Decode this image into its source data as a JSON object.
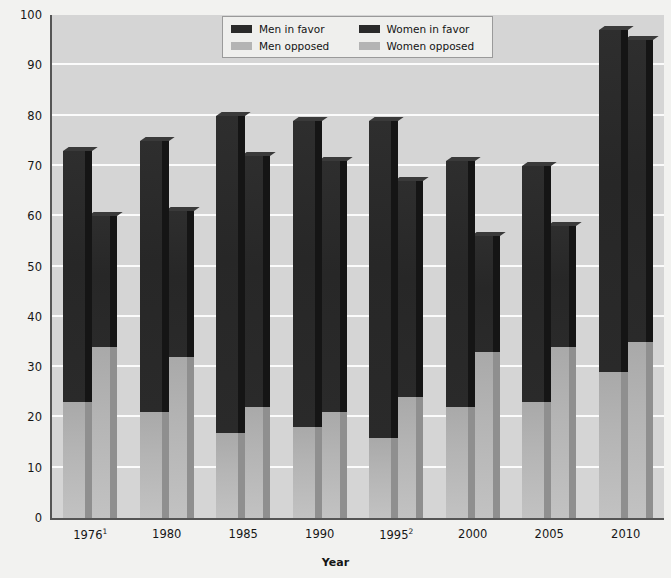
{
  "chart_data": {
    "type": "bar",
    "subtype": "grouped-stacked-3d",
    "title": "",
    "xlabel": "Year",
    "ylabel": "",
    "ylim": [
      0,
      100
    ],
    "ytick_values": [
      0,
      10,
      20,
      30,
      40,
      50,
      60,
      70,
      80,
      90,
      100
    ],
    "ytick_labels": [
      "0",
      "10",
      "20",
      "30",
      "40",
      "50",
      "60",
      "70",
      "80",
      "90",
      "100"
    ],
    "grid": "horizontal",
    "legend_position": "top-center",
    "categories": [
      "1976",
      "1980",
      "1985",
      "1990",
      "1995",
      "2000",
      "2005",
      "2010"
    ],
    "category_labels": [
      "1976¹",
      "1980",
      "1985",
      "1990",
      "1995²",
      "2000",
      "2005",
      "2010"
    ],
    "category_footnotes": [
      "1",
      "",
      "",
      "",
      "2",
      "",
      "",
      ""
    ],
    "series": [
      {
        "name": "Men in favor",
        "group": "Men",
        "stack": "top",
        "color": "#2a2a2a",
        "values": [
          73,
          75,
          80,
          79,
          79,
          71,
          70,
          97
        ]
      },
      {
        "name": "Men opposed",
        "group": "Men",
        "stack": "bottom",
        "color": "#b4b4b4",
        "values": [
          23,
          21,
          17,
          18,
          16,
          22,
          23,
          29
        ]
      },
      {
        "name": "Women in favor",
        "group": "Women",
        "stack": "top",
        "color": "#2a2a2a",
        "values": [
          60,
          61,
          72,
          71,
          67,
          56,
          58,
          95
        ]
      },
      {
        "name": "Women opposed",
        "group": "Women",
        "stack": "bottom",
        "color": "#b4b4b4",
        "values": [
          34,
          32,
          22,
          21,
          24,
          33,
          34,
          35
        ]
      }
    ]
  },
  "legend": {
    "items": [
      {
        "label": "Men in favor",
        "swatch": "#2a2a2a",
        "icon": "legend-swatch-dark"
      },
      {
        "label": "Women in favor",
        "swatch": "#2a2a2a",
        "icon": "legend-swatch-dark"
      },
      {
        "label": "Men opposed",
        "swatch": "#b4b4b4",
        "icon": "legend-swatch-light"
      },
      {
        "label": "Women opposed",
        "swatch": "#b4b4b4",
        "icon": "legend-swatch-light"
      }
    ]
  },
  "axes": {
    "x_title": "Year",
    "y_title": ""
  },
  "colors": {
    "plot_background": "#d5d5d5",
    "page_background": "#f2f2f0",
    "gridline": "#fbfbfb",
    "axis_line": "#555555",
    "favor_face": "#2a2a2a",
    "favor_side": "#151515",
    "opposed_face": "#b4b4b4",
    "opposed_side": "#8f8f8f",
    "legend_background": "#efefed",
    "legend_border": "#9a9a9a",
    "text": "#161616"
  }
}
